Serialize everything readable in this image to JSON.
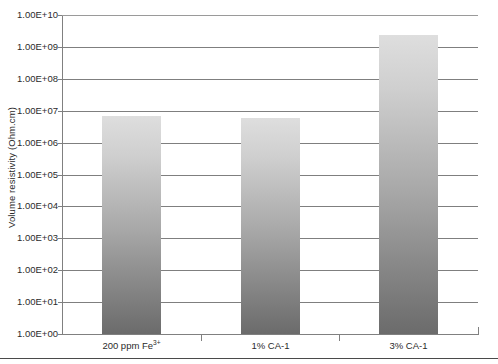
{
  "chart_data": {
    "type": "bar",
    "title": "",
    "xlabel": "",
    "ylabel": "Volume resistivity (Ohm.cm)",
    "yscale": "log",
    "ylim": [
      1,
      10000000000
    ],
    "grid": true,
    "legend": null,
    "categories": [
      "200 ppm Fe3+",
      "1% CA-1",
      "3% CA-1"
    ],
    "categories_display": [
      {
        "main": "200 ppm Fe",
        "sup": "3+"
      },
      {
        "main": "1% CA-1",
        "sup": ""
      },
      {
        "main": "3% CA-1",
        "sup": ""
      }
    ],
    "values": [
      7000000,
      6000000,
      2400000000
    ],
    "value_labels": [
      "7.0E+06",
      "6.0E+06",
      "2.4E+09"
    ],
    "ytick_labels": [
      "1.00E+10",
      "1.00E+09",
      "1.00E+08",
      "1.00E+07",
      "1.00E+06",
      "1.00E+05",
      "1.00E+04",
      "1.00E+03",
      "1.00E+02",
      "1.00E+01",
      "1.00E+00"
    ],
    "ytick_values": [
      10000000000,
      1000000000,
      100000000,
      10000000,
      1000000,
      100000,
      10000,
      1000,
      100,
      10,
      1
    ]
  },
  "style": {
    "bar_gradient_top": "#dedede",
    "bar_gradient_bottom": "#6b6b6b",
    "gridline_color": "#7f7f7f",
    "axis_color": "#808080",
    "text_color": "#2b2b2b",
    "background": "#ffffff"
  }
}
